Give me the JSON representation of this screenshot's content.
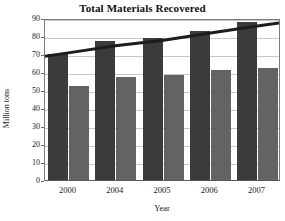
{
  "chart_data": {
    "type": "bar",
    "title": "Total Materials Recovered",
    "xlabel": "Year",
    "ylabel": "Million tons",
    "categories": [
      "2000",
      "2004",
      "2005",
      "2006",
      "2007"
    ],
    "series": [
      {
        "name": "series-dark",
        "values": [
          70,
          77,
          79,
          83,
          88
        ],
        "color": "#3b3b3b"
      },
      {
        "name": "series-light",
        "values": [
          52.5,
          57,
          58.5,
          61,
          62.5
        ],
        "color": "#636363"
      }
    ],
    "overlay_line": {
      "name": "trend-line",
      "values": [
        71.5,
        75.5,
        78.5,
        82.5,
        86.5
      ],
      "color": "#1d1d1d"
    },
    "ylim": [
      0,
      90
    ],
    "yticks": [
      90,
      80,
      70,
      60,
      50,
      40,
      30,
      20,
      10,
      0
    ],
    "ytick_labels": [
      "90",
      "80",
      "70",
      "60",
      "50",
      "40",
      "30",
      "20",
      "10",
      "0"
    ],
    "grid": true,
    "legend": null
  },
  "colors": {
    "bar_dark": "#3b3b3b",
    "bar_light": "#636363",
    "grid": "#c9c9c9",
    "axis": "#6a6a6a",
    "line": "#1d1d1d",
    "background": "#ffffff"
  }
}
